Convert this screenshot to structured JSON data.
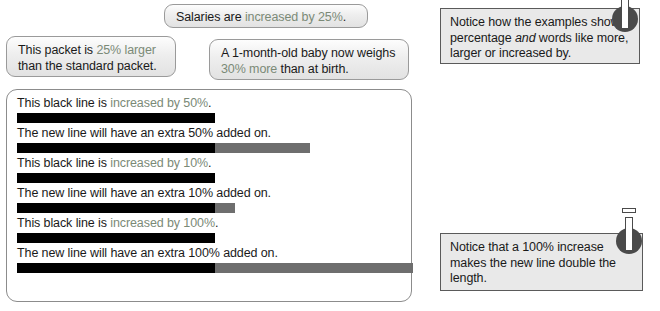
{
  "bubbles": [
    {
      "name": "salaries",
      "pre": "Salaries are ",
      "highlight": "increased by 25%",
      "post": "."
    },
    {
      "name": "packet",
      "pre": "This packet is ",
      "highlight": "25% larger",
      "post": " than the standard packet."
    },
    {
      "name": "baby",
      "pre": "A 1-month-old baby now weighs ",
      "highlight": "30% more",
      "post": " than at birth."
    }
  ],
  "lines_panel": {
    "rows": [
      {
        "label_pre": "This black line is ",
        "label_highlight": "increased by 50%",
        "label_post": ".",
        "black_px": 198,
        "gray_px": 0,
        "top": 6,
        "bar_top": 20
      },
      {
        "label_pre": "The new line will have an extra 50% added on.",
        "label_highlight": "",
        "label_post": "",
        "black_px": 198,
        "gray_px": 95,
        "top": 36,
        "bar_top": 50
      },
      {
        "label_pre": "This black line is ",
        "label_highlight": "increased by 10%",
        "label_post": ".",
        "black_px": 198,
        "gray_px": 0,
        "top": 66,
        "bar_top": 80
      },
      {
        "label_pre": "The new line will have an extra 10% added on.",
        "label_highlight": "",
        "label_post": "",
        "black_px": 198,
        "gray_px": 20,
        "top": 96,
        "bar_top": 110
      },
      {
        "label_pre": "This black line is ",
        "label_highlight": "increased by 100%",
        "label_post": ".",
        "black_px": 198,
        "gray_px": 0,
        "top": 126,
        "bar_top": 140
      },
      {
        "label_pre": "The new line will have an extra 100% added on.",
        "label_highlight": "",
        "label_post": "",
        "black_px": 198,
        "gray_px": 198,
        "top": 156,
        "bar_top": 170
      }
    ]
  },
  "notices": [
    {
      "name": "top",
      "part1": "Notice how the examples show a percentage ",
      "emphasis": "and",
      "part2": " words like more, larger or increased by.",
      "icon": "info-pin-icon"
    },
    {
      "name": "bottom",
      "part1": "Notice that a 100% increase makes the new line double the length.",
      "emphasis": "",
      "part2": "",
      "icon": "info-pin-icon"
    }
  ],
  "colors": {
    "highlight_text": "#7b8a77",
    "bar_black": "#000000",
    "bar_gray": "#6e6e6e",
    "notice_bg": "#e9e9e9",
    "bubble_border": "#9a9a9a"
  }
}
